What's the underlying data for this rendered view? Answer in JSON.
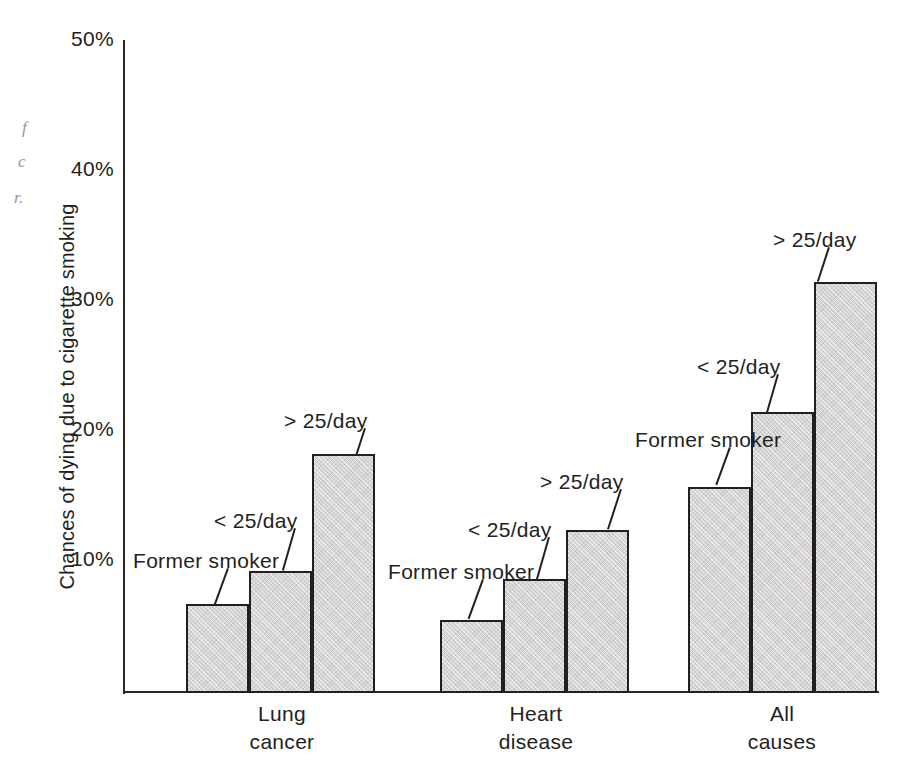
{
  "figure": {
    "background_color": "#ffffff",
    "ink_color": "#231f20",
    "bar_fill_color": "#d6d5d3"
  },
  "margin_fragments": [
    {
      "text": "f",
      "x": 22,
      "y": 118
    },
    {
      "text": "c",
      "x": 18,
      "y": 152
    },
    {
      "text": "r.",
      "x": 14,
      "y": 188
    }
  ],
  "chart_data": {
    "type": "bar",
    "title": "",
    "xlabel": "",
    "ylabel": "Chances of dying due to cigarette smoking",
    "ylim": [
      0,
      50
    ],
    "yticks": [
      10,
      20,
      30,
      40,
      50
    ],
    "ytick_labels": [
      "10%",
      "20%",
      "30%",
      "40%",
      "50%"
    ],
    "grid": false,
    "legend_position": "none",
    "categories": [
      "Lung cancer",
      "Heart disease",
      "All causes"
    ],
    "category_lines": [
      [
        "Lung",
        "cancer"
      ],
      [
        "Heart",
        "disease"
      ],
      [
        "All",
        "causes"
      ]
    ],
    "series": [
      {
        "name": "Former smoker",
        "values": [
          6.7,
          5.5,
          15.7
        ]
      },
      {
        "name": "< 25/day",
        "values": [
          9.2,
          8.6,
          21.5
        ]
      },
      {
        "name": "> 25/day",
        "values": [
          18.2,
          12.4,
          31.5
        ]
      }
    ],
    "annotations": [
      {
        "text": "Former smoker",
        "group": "Lung cancer",
        "series": "Former smoker",
        "value": 6.7
      },
      {
        "text": "< 25/day",
        "group": "Lung cancer",
        "series": "< 25/day",
        "value": 9.2
      },
      {
        "text": "> 25/day",
        "group": "Lung cancer",
        "series": "> 25/day",
        "value": 18.2
      },
      {
        "text": "Former smoker",
        "group": "Heart disease",
        "series": "Former smoker",
        "value": 5.5
      },
      {
        "text": "< 25/day",
        "group": "Heart disease",
        "series": "< 25/day",
        "value": 8.6
      },
      {
        "text": "> 25/day",
        "group": "Heart disease",
        "series": "> 25/day",
        "value": 12.4
      },
      {
        "text": "Former smoker",
        "group": "All causes",
        "series": "Former smoker",
        "value": 15.7
      },
      {
        "text": "< 25/day",
        "group": "All causes",
        "series": "< 25/day",
        "value": 21.5
      },
      {
        "text": "> 25/day",
        "group": "All causes",
        "series": "> 25/day",
        "value": 31.5
      }
    ]
  },
  "layout": {
    "plot_left": 124,
    "plot_baseline_y": 691,
    "px_per_percent": 13.0,
    "bar_width": 63,
    "group_starts": [
      186,
      440,
      688
    ],
    "annotation_boxes": [
      {
        "text": "Former smoker",
        "x": 133,
        "y": 549,
        "leader_x": 227,
        "leader_y": 568,
        "leader_len": 40,
        "leader_angle": 20
      },
      {
        "text": "< 25/day",
        "x": 214,
        "y": 509,
        "leader_x": 294,
        "leader_y": 528,
        "leader_len": 44,
        "leader_angle": 16
      },
      {
        "text": "> 25/day",
        "x": 284,
        "y": 409,
        "leader_x": 364,
        "leader_y": 428,
        "leader_len": 28,
        "leader_angle": 18
      },
      {
        "text": "Former smoker",
        "x": 388,
        "y": 560,
        "leader_x": 482,
        "leader_y": 579,
        "leader_len": 42,
        "leader_angle": 20
      },
      {
        "text": "< 25/day",
        "x": 468,
        "y": 518,
        "leader_x": 548,
        "leader_y": 537,
        "leader_len": 44,
        "leader_angle": 16
      },
      {
        "text": "> 25/day",
        "x": 540,
        "y": 470,
        "leader_x": 620,
        "leader_y": 489,
        "leader_len": 42,
        "leader_angle": 18
      },
      {
        "text": "Former smoker",
        "x": 635,
        "y": 428,
        "leader_x": 729,
        "leader_y": 447,
        "leader_len": 40,
        "leader_angle": 20
      },
      {
        "text": "< 25/day",
        "x": 697,
        "y": 355,
        "leader_x": 777,
        "leader_y": 374,
        "leader_len": 40,
        "leader_angle": 16
      },
      {
        "text": "> 25/day",
        "x": 773,
        "y": 228,
        "leader_x": 828,
        "leader_y": 247,
        "leader_len": 36,
        "leader_angle": 18
      }
    ],
    "category_label_positions": [
      {
        "x": 282,
        "y": 700
      },
      {
        "x": 536,
        "y": 700
      },
      {
        "x": 782,
        "y": 700
      }
    ]
  }
}
